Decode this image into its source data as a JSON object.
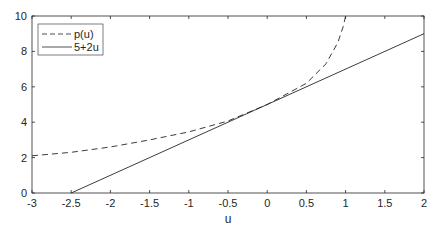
{
  "chart_data": {
    "type": "line",
    "title": "",
    "xlabel": "u",
    "ylabel": "",
    "xlim": [
      -3,
      2
    ],
    "ylim": [
      0,
      10
    ],
    "xticks": [
      -3,
      -2.5,
      -2,
      -1.5,
      -1,
      -0.5,
      0,
      0.5,
      1,
      1.5,
      2
    ],
    "xtick_labels": [
      "-3",
      "-2.5",
      "-2",
      "-1.5",
      "-1",
      "-0.5",
      "0",
      "0.5",
      "1",
      "1.5",
      "2"
    ],
    "yticks": [
      0,
      2,
      4,
      6,
      8,
      10
    ],
    "ytick_labels": [
      "0",
      "2",
      "4",
      "6",
      "8",
      "10"
    ],
    "grid": false,
    "legend_position": "upper left",
    "series": [
      {
        "name": "p(u)",
        "style": "dashed",
        "x": [
          -3,
          -2.5,
          -2,
          -1.5,
          -1,
          -0.5,
          0,
          0.25,
          0.5,
          0.75,
          0.9,
          0.97,
          1.0
        ],
        "y": [
          2.1,
          2.3,
          2.6,
          3.0,
          3.45,
          4.07,
          5.0,
          5.6,
          6.2,
          7.3,
          8.5,
          9.4,
          10.0
        ]
      },
      {
        "name": "5+2u",
        "style": "solid",
        "x": [
          -2.5,
          2
        ],
        "y": [
          0,
          9
        ]
      }
    ]
  }
}
